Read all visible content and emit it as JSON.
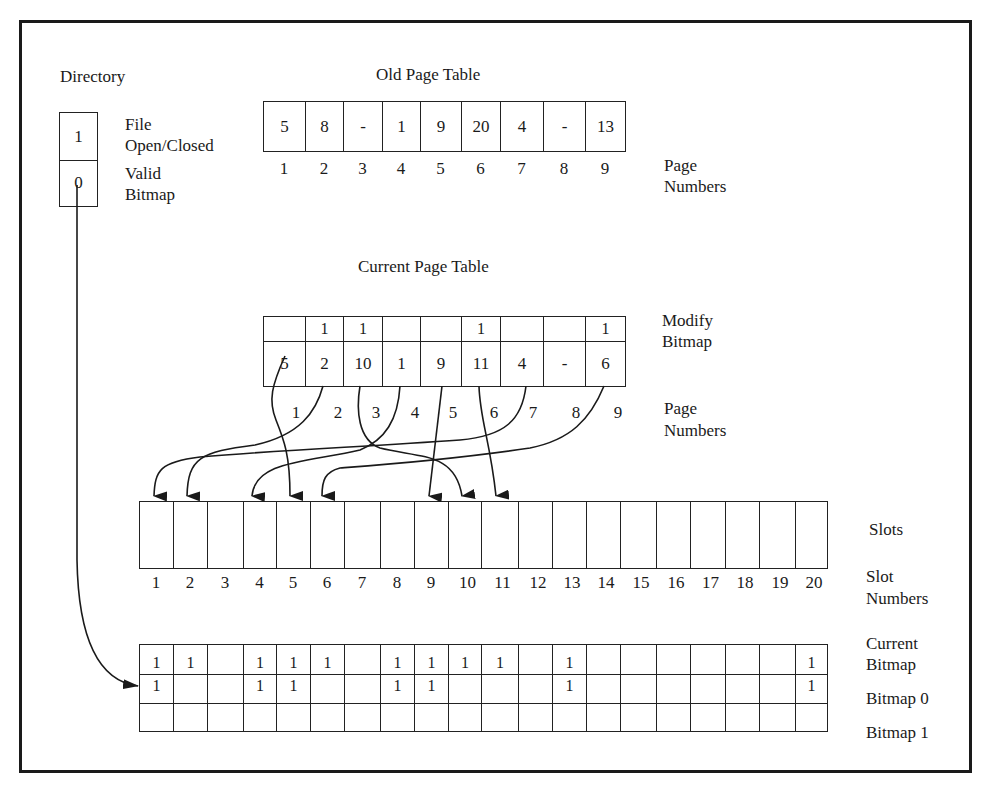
{
  "directory": {
    "title": "Directory",
    "cells": [
      {
        "value": "1",
        "label": "File Open/Closed",
        "label_lines": [
          "File",
          "Open/Closed"
        ]
      },
      {
        "value": "0",
        "label": "Valid Bitmap",
        "label_lines": [
          "Valid",
          "Bitmap"
        ]
      }
    ]
  },
  "old_page_table": {
    "title": "Old Page Table",
    "entries": [
      "5",
      "8",
      "-",
      "1",
      "9",
      "20",
      "4",
      "-",
      "13"
    ],
    "page_numbers": [
      "1",
      "2",
      "3",
      "4",
      "5",
      "6",
      "7",
      "8",
      "9"
    ],
    "page_numbers_label": [
      "Page",
      "Numbers"
    ]
  },
  "current_page_table": {
    "title": "Current Page Table",
    "modify_bitmap": [
      "",
      "1",
      "1",
      "",
      "",
      "1",
      "",
      "",
      "1"
    ],
    "modify_bitmap_label": [
      "Modify",
      "Bitmap"
    ],
    "entries": [
      "5",
      "2",
      "10",
      "1",
      "9",
      "11",
      "4",
      "-",
      "6"
    ],
    "page_numbers": [
      "1",
      "2",
      "3",
      "4",
      "5",
      "6",
      "7",
      "8",
      "9"
    ],
    "page_numbers_label": [
      "Page",
      "Numbers"
    ]
  },
  "slots": {
    "label": "Slots",
    "slot_numbers": [
      "1",
      "2",
      "3",
      "4",
      "5",
      "6",
      "7",
      "8",
      "9",
      "10",
      "11",
      "12",
      "13",
      "14",
      "15",
      "16",
      "17",
      "18",
      "19",
      "20"
    ],
    "slot_numbers_label": [
      "Slot",
      "Numbers"
    ]
  },
  "bitmaps": {
    "current_bitmap_label": [
      "Current",
      "Bitmap"
    ],
    "bitmap0_label": "Bitmap 0",
    "bitmap1_label": "Bitmap 1",
    "current_bitmap": [
      "1",
      "1",
      "",
      "1",
      "1",
      "1",
      "",
      "1",
      "1",
      "1",
      "1",
      "",
      "1",
      "",
      "",
      "",
      "",
      "",
      "",
      "1"
    ],
    "bitmap0": [
      "1",
      "",
      "",
      "1",
      "1",
      "",
      "",
      "1",
      "1",
      "",
      "",
      "",
      "1",
      "",
      "",
      "",
      "",
      "",
      "",
      "1"
    ],
    "bitmap1": [
      "",
      "",
      "",
      "",
      "",
      "",
      "",
      "",
      "",
      "",
      "",
      "",
      "",
      "",
      "",
      "",
      "",
      "",
      "",
      ""
    ]
  },
  "mappings": [
    {
      "page": 1,
      "slot": 5
    },
    {
      "page": 2,
      "slot": 2
    },
    {
      "page": 3,
      "slot": 10
    },
    {
      "page": 4,
      "slot": 1
    },
    {
      "page": 5,
      "slot": 9
    },
    {
      "page": 6,
      "slot": 11
    },
    {
      "page": 7,
      "slot": 4
    },
    {
      "page": 9,
      "slot": 6
    },
    {
      "directory": "Valid Bitmap",
      "target": "Bitmap 0"
    }
  ]
}
